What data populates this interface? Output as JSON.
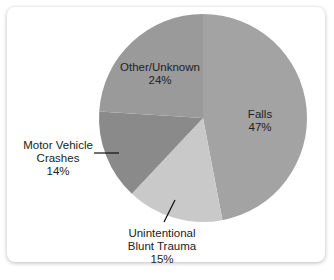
{
  "chart_data": {
    "type": "pie",
    "title": "",
    "slices": [
      {
        "label": "Falls",
        "value": 47,
        "display": "47%",
        "color": "#a3a3a3"
      },
      {
        "label": "Unintentional Blunt Trauma",
        "value": 15,
        "display": "15%",
        "color": "#c9c9c9"
      },
      {
        "label": "Motor Vehicle Crashes",
        "value": 14,
        "display": "14%",
        "color": "#8a8a8a"
      },
      {
        "label": "Other/Unknown",
        "value": 24,
        "display": "24%",
        "color": "#9a9a9a"
      }
    ]
  },
  "labels": {
    "falls": {
      "line1": "Falls",
      "pct": "47%"
    },
    "blunt": {
      "line1": "Unintentional",
      "line2": "Blunt Trauma",
      "pct": "15%"
    },
    "motor": {
      "line1": "Motor Vehicle",
      "line2": "Crashes",
      "pct": "14%"
    },
    "other": {
      "line1": "Other/Unknown",
      "pct": "24%"
    }
  }
}
